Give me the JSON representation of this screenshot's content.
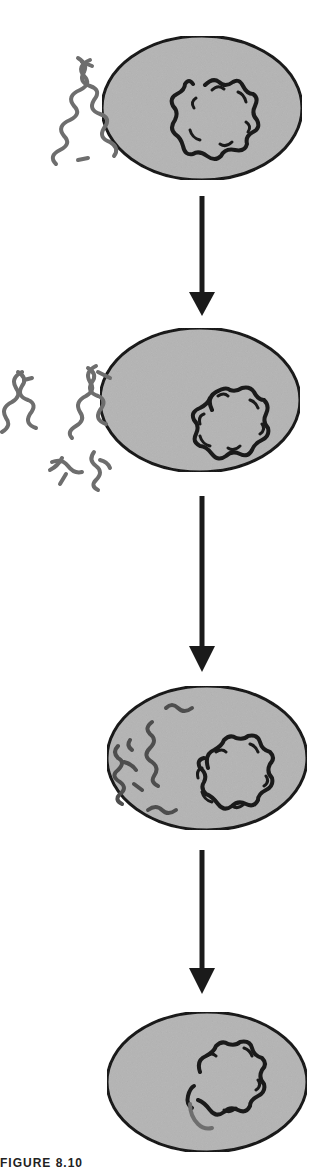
{
  "diagram": {
    "stages": [
      {
        "id": 1,
        "label": "Donor DNA fragment outside recipient cell",
        "cell_center": [
          202,
          108
        ],
        "chromosome": "circular"
      },
      {
        "id": 2,
        "label": "DNA fragments bind and one strand enters cell",
        "cell_center": [
          200,
          400
        ],
        "chromosome": "circular"
      },
      {
        "id": 3,
        "label": "Single-stranded DNA inside cytoplasm",
        "cell_center": [
          207,
          758
        ],
        "chromosome": "circular"
      },
      {
        "id": 4,
        "label": "Donor DNA integrated into chromosome",
        "cell_center": [
          207,
          1082
        ],
        "chromosome": "circular-recombinant"
      }
    ],
    "arrows": [
      {
        "from": 1,
        "to": 2
      },
      {
        "from": 2,
        "to": 3
      },
      {
        "from": 3,
        "to": 4
      }
    ],
    "colors": {
      "cell_fill": "#b8b8b8",
      "cell_outline": "#1a1a1a",
      "chromosome": "#1a1a1a",
      "donor_dna": "#6e6e6e",
      "arrow": "#1a1a1a"
    },
    "caption": "FIGURE 8.10"
  }
}
